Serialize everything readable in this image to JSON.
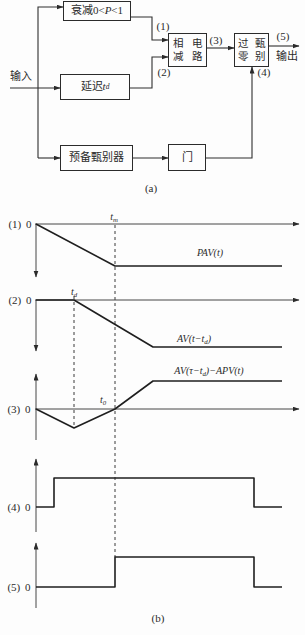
{
  "canvas": {
    "bg": "#fdfdfd",
    "ink": "#2b2b2b"
  },
  "panel_a": {
    "caption": "(a)",
    "input_label": "输入",
    "output_label": "输出",
    "boxes": {
      "attenuation": {
        "label": [
          {
            "t": "衰减0<"
          },
          {
            "t": "P",
            "s": "i"
          },
          {
            "t": "<1"
          }
        ]
      },
      "delay": {
        "label": [
          {
            "t": "延迟"
          },
          {
            "t": "t",
            "s": "i"
          },
          {
            "t": "d",
            "s": "sub"
          }
        ]
      },
      "pre_discriminator": {
        "label": [
          {
            "t": "预备甄别器"
          }
        ]
      },
      "subtractor": {
        "label": [
          {
            "t": "相减"
          },
          {
            "s": "br"
          },
          {
            "t": "电路"
          }
        ]
      },
      "zero_crossing": {
        "label": [
          {
            "t": "过零"
          },
          {
            "s": "br"
          },
          {
            "t": "甄别"
          }
        ]
      },
      "gate": {
        "label": [
          {
            "t": "门"
          }
        ]
      }
    },
    "signal_tags": {
      "s1": "(1)",
      "s2": "(2)",
      "s3": "(3)",
      "s4": "(4)",
      "s5": "(5)"
    },
    "connectors": [
      {
        "name": "input-line",
        "pts": [
          [
            10,
            88
          ],
          [
            60,
            88
          ]
        ],
        "arrow": "end"
      },
      {
        "name": "trunk-to-attenuation",
        "pts": [
          [
            38,
            158
          ],
          [
            38,
            7
          ],
          [
            63,
            7
          ]
        ],
        "arrow": "end"
      },
      {
        "name": "trunk-to-prediscriminator",
        "pts": [
          [
            38,
            158
          ],
          [
            60,
            158
          ]
        ],
        "arrow": "end"
      },
      {
        "name": "attenuation-to-subtractor",
        "pts": [
          [
            131,
            17
          ],
          [
            152,
            17
          ],
          [
            152,
            40
          ],
          [
            168,
            40
          ]
        ],
        "arrow": "end"
      },
      {
        "name": "delay-to-subtractor",
        "pts": [
          [
            130,
            88
          ],
          [
            152,
            88
          ],
          [
            152,
            57
          ],
          [
            168,
            57
          ]
        ],
        "arrow": "end"
      },
      {
        "name": "subtractor-to-zerocross",
        "pts": [
          [
            207,
            48
          ],
          [
            234,
            48
          ]
        ],
        "arrow": "end"
      },
      {
        "name": "zerocross-output",
        "pts": [
          [
            269,
            46
          ],
          [
            299,
            46
          ]
        ],
        "arrow": "end"
      },
      {
        "name": "prediscriminator-to-gate",
        "pts": [
          [
            133,
            158
          ],
          [
            168,
            158
          ]
        ],
        "arrow": "end"
      },
      {
        "name": "gate-to-zerocross",
        "pts": [
          [
            206,
            158
          ],
          [
            252,
            158
          ],
          [
            252,
            67
          ]
        ],
        "arrow": "end"
      }
    ]
  },
  "panel_b": {
    "caption": "(b)",
    "rows": [
      {
        "name": "row-1",
        "tag": "(1) 0",
        "time_label": [
          {
            "t": "t",
            "s": "i"
          },
          {
            "t": "m",
            "s": "sub"
          }
        ],
        "curve_label": [
          {
            "t": "PAV(t)",
            "s": "i"
          }
        ],
        "h_axis": [
          [
            35,
            224
          ],
          [
            299,
            224
          ]
        ],
        "v_axis": [
          [
            36,
            224
          ],
          [
            36,
            277
          ]
        ],
        "wave": [
          [
            36,
            224
          ],
          [
            115,
            266
          ],
          [
            282,
            266
          ]
        ]
      },
      {
        "name": "row-2",
        "tag": "(2) 0",
        "time_label": [
          {
            "t": "t",
            "s": "i"
          },
          {
            "t": "d",
            "s": "sub"
          }
        ],
        "curve_label": [
          {
            "t": "AV(t−t",
            "s": "i"
          },
          {
            "t": "d",
            "s": "sub"
          },
          {
            "t": ")",
            "s": "i"
          }
        ],
        "h_axis": [
          [
            35,
            300
          ],
          [
            299,
            300
          ]
        ],
        "v_axis": [
          [
            36,
            300
          ],
          [
            36,
            351
          ]
        ],
        "wave": [
          [
            36,
            300
          ],
          [
            74,
            300
          ],
          [
            153,
            347
          ],
          [
            282,
            347
          ]
        ]
      },
      {
        "name": "row-3",
        "tag": "(3) 0",
        "time_label": [
          {
            "t": "t",
            "s": "i"
          },
          {
            "t": "0",
            "s": "sub"
          }
        ],
        "curve_label": [
          {
            "t": "AV(τ−t",
            "s": "i"
          },
          {
            "t": "d",
            "s": "sub"
          },
          {
            "t": ")−APV(t)",
            "s": "i"
          }
        ],
        "h_axis": [
          [
            35,
            409
          ],
          [
            299,
            409
          ]
        ],
        "v_axis": [
          [
            36,
            440
          ],
          [
            36,
            374
          ]
        ],
        "wave": [
          [
            36,
            409
          ],
          [
            74,
            428
          ],
          [
            115,
            409
          ],
          [
            153,
            381
          ],
          [
            282,
            381
          ]
        ]
      },
      {
        "name": "row-4",
        "tag": "(4) 0",
        "v_axis": [
          [
            36,
            532
          ],
          [
            36,
            459
          ]
        ],
        "wave": [
          [
            36,
            507
          ],
          [
            54,
            507
          ],
          [
            54,
            478
          ],
          [
            254,
            478
          ],
          [
            254,
            507
          ],
          [
            282,
            507
          ]
        ]
      },
      {
        "name": "row-5",
        "tag": "(5) 0",
        "v_axis": [
          [
            36,
            608
          ],
          [
            36,
            543
          ]
        ],
        "wave": [
          [
            36,
            587
          ],
          [
            115,
            587
          ],
          [
            115,
            557
          ],
          [
            254,
            557
          ],
          [
            254,
            587
          ],
          [
            282,
            587
          ]
        ]
      }
    ],
    "dashed_lines": [
      {
        "name": "tm-t0-dashed-line",
        "pts": [
          [
            115,
            225
          ],
          [
            115,
            557
          ]
        ]
      },
      {
        "name": "td-dashed-line",
        "pts": [
          [
            74,
            296
          ],
          [
            74,
            427
          ]
        ]
      }
    ]
  }
}
